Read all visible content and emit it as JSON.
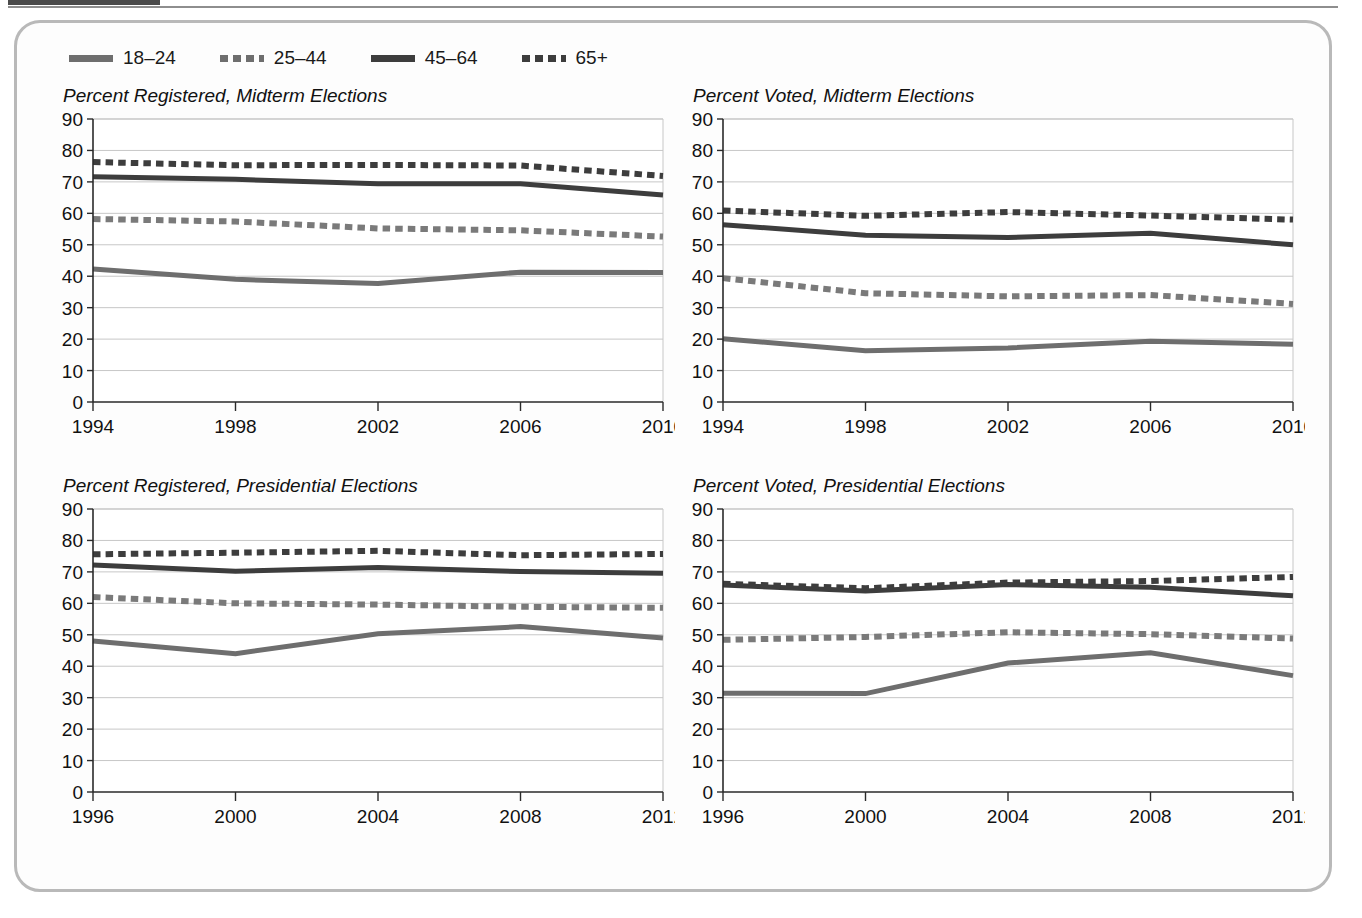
{
  "figure": {
    "legend": {
      "entries": [
        {
          "label": "18–24",
          "style": "solid",
          "color": "#6e6e6e",
          "swatch_class": "swatch-solid-light"
        },
        {
          "label": "25–44",
          "style": "dotted",
          "color": "#7a7a7a",
          "swatch_class": "swatch-dotted-light"
        },
        {
          "label": "45–64",
          "style": "solid",
          "color": "#3d3d3d",
          "swatch_class": "swatch-solid-dark"
        },
        {
          "label": "65+",
          "style": "dotted",
          "color": "#3d3d3d",
          "swatch_class": "swatch-dotted-dark"
        }
      ]
    }
  },
  "chart_data": [
    {
      "type": "line",
      "title": "Percent Registered, Midterm Elections",
      "xlabel": "",
      "ylabel": "",
      "ylim": [
        0,
        90
      ],
      "ytick_step": 10,
      "grid": true,
      "legend_position": "top",
      "categories": [
        "1994",
        "1998",
        "2002",
        "2006",
        "2010"
      ],
      "yticks": [
        "0",
        "10",
        "20",
        "30",
        "40",
        "50",
        "60",
        "70",
        "80",
        "90"
      ],
      "series": [
        {
          "name": "18–24",
          "style": "solid",
          "color": "#6e6e6e",
          "width": 5,
          "values": [
            42.3,
            39.0,
            37.7,
            41.3,
            41.2
          ]
        },
        {
          "name": "25–44",
          "style": "dotted",
          "color": "#7a7a7a",
          "width": 6,
          "values": [
            58.2,
            57.4,
            55.2,
            54.6,
            52.6
          ]
        },
        {
          "name": "45–64",
          "style": "solid",
          "color": "#3d3d3d",
          "width": 5,
          "values": [
            71.6,
            70.8,
            69.4,
            69.4,
            65.8
          ]
        },
        {
          "name": "65+",
          "style": "dotted",
          "color": "#3d3d3d",
          "width": 6,
          "values": [
            76.3,
            75.3,
            75.4,
            75.2,
            71.9
          ]
        }
      ]
    },
    {
      "type": "line",
      "title": "Percent Voted, Midterm Elections",
      "xlabel": "",
      "ylabel": "",
      "ylim": [
        0,
        90
      ],
      "ytick_step": 10,
      "grid": true,
      "legend_position": "top",
      "categories": [
        "1994",
        "1998",
        "2002",
        "2006",
        "2010"
      ],
      "yticks": [
        "0",
        "10",
        "20",
        "30",
        "40",
        "50",
        "60",
        "70",
        "80",
        "90"
      ],
      "series": [
        {
          "name": "18–24",
          "style": "solid",
          "color": "#6e6e6e",
          "width": 5,
          "values": [
            20.1,
            16.3,
            17.2,
            19.3,
            18.4
          ]
        },
        {
          "name": "25–44",
          "style": "dotted",
          "color": "#7a7a7a",
          "width": 6,
          "values": [
            39.4,
            34.6,
            33.6,
            34.0,
            31.2
          ]
        },
        {
          "name": "45–64",
          "style": "solid",
          "color": "#3d3d3d",
          "width": 5,
          "values": [
            56.4,
            53.0,
            52.3,
            53.7,
            50.0
          ]
        },
        {
          "name": "65+",
          "style": "dotted",
          "color": "#3d3d3d",
          "width": 6,
          "values": [
            60.9,
            59.2,
            60.4,
            59.3,
            58.0
          ]
        }
      ]
    },
    {
      "type": "line",
      "title": "Percent Registered, Presidential Elections",
      "xlabel": "",
      "ylabel": "",
      "ylim": [
        0,
        90
      ],
      "ytick_step": 10,
      "grid": true,
      "legend_position": "top",
      "categories": [
        "1996",
        "2000",
        "2004",
        "2008",
        "2012"
      ],
      "yticks": [
        "0",
        "10",
        "20",
        "30",
        "40",
        "50",
        "60",
        "70",
        "80",
        "90"
      ],
      "series": [
        {
          "name": "18–24",
          "style": "solid",
          "color": "#6e6e6e",
          "width": 5,
          "values": [
            48.0,
            44.0,
            50.3,
            52.6,
            49.0
          ]
        },
        {
          "name": "25–44",
          "style": "dotted",
          "color": "#7a7a7a",
          "width": 6,
          "values": [
            62.0,
            60.0,
            59.6,
            58.9,
            58.6
          ]
        },
        {
          "name": "45–64",
          "style": "solid",
          "color": "#3d3d3d",
          "width": 5,
          "values": [
            72.2,
            70.2,
            71.4,
            70.1,
            69.6
          ]
        },
        {
          "name": "65+",
          "style": "dotted",
          "color": "#3d3d3d",
          "width": 6,
          "values": [
            75.6,
            76.1,
            76.7,
            75.3,
            75.7
          ]
        }
      ]
    },
    {
      "type": "line",
      "title": "Percent Voted, Presidential Elections",
      "xlabel": "",
      "ylabel": "",
      "ylim": [
        0,
        90
      ],
      "ytick_step": 10,
      "grid": true,
      "legend_position": "top",
      "categories": [
        "1996",
        "2000",
        "2004",
        "2008",
        "2012"
      ],
      "yticks": [
        "0",
        "10",
        "20",
        "30",
        "40",
        "50",
        "60",
        "70",
        "80",
        "90"
      ],
      "series": [
        {
          "name": "18–24",
          "style": "solid",
          "color": "#6e6e6e",
          "width": 5,
          "values": [
            31.4,
            31.3,
            41.0,
            44.3,
            37.0
          ]
        },
        {
          "name": "25–44",
          "style": "dotted",
          "color": "#7a7a7a",
          "width": 6,
          "values": [
            48.4,
            49.3,
            50.8,
            50.2,
            48.8
          ]
        },
        {
          "name": "45–64",
          "style": "solid",
          "color": "#3d3d3d",
          "width": 5,
          "values": [
            65.8,
            63.9,
            66.0,
            65.1,
            62.4
          ]
        },
        {
          "name": "65+",
          "style": "dotted",
          "color": "#3d3d3d",
          "width": 6,
          "values": [
            66.2,
            64.8,
            66.6,
            67.1,
            68.4
          ]
        }
      ]
    }
  ]
}
